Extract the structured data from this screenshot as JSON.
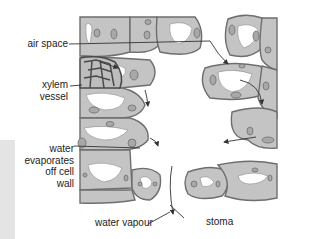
{
  "diagram": {
    "title": "",
    "labels": {
      "air_space": "air space",
      "xylem_vessel_line1": "xylem",
      "xylem_vessel_line2": "vessel",
      "water_evap_line1": "water",
      "water_evap_line2": "evaporates",
      "water_evap_line3": "off cell",
      "water_evap_line4": "wall",
      "water_vapour": "water vapour",
      "stoma": "stoma"
    },
    "colors": {
      "cell_fill": "#c4c4c4",
      "cell_outline": "#6e6e6e",
      "chloroplast_fill": "#a8a8a8",
      "vacuole_fill": "#ffffff",
      "xylem_wall": "#4a4a4a",
      "arrow": "#333333",
      "side_panel": "#e4e4e4"
    }
  }
}
